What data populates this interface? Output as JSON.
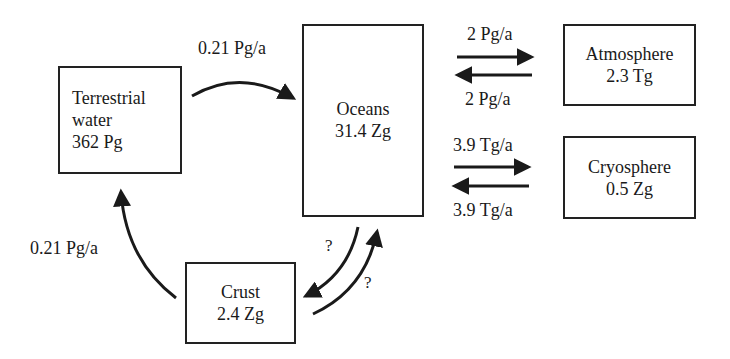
{
  "diagram": {
    "nodes": {
      "terrestrial": {
        "name_line1": "Terrestrial",
        "name_line2": "water",
        "amount": "362 Pg"
      },
      "oceans": {
        "name": "Oceans",
        "amount": "31.4 Zg"
      },
      "atmosphere": {
        "name": "Atmosphere",
        "amount": "2.3 Tg"
      },
      "cryosphere": {
        "name": "Cryosphere",
        "amount": "0.5 Zg"
      },
      "crust": {
        "name": "Crust",
        "amount": "2.4 Zg"
      }
    },
    "flows": {
      "terrestrial_to_oceans": "0.21 Pg/a",
      "oceans_to_atmosphere": "2 Pg/a",
      "atmosphere_to_oceans": "2 Pg/a",
      "oceans_to_cryosphere": "3.9 Tg/a",
      "cryosphere_to_oceans": "3.9 Tg/a",
      "crust_to_terrestrial": "0.21 Pg/a",
      "oceans_to_crust": "?",
      "crust_to_oceans": "?"
    },
    "colors": {
      "stroke": "#1a1a1a",
      "background": "#ffffff"
    }
  }
}
